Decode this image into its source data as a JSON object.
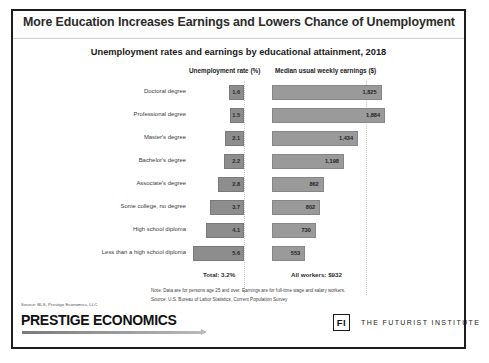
{
  "slide": {
    "title": "More Education Increases Earnings and Lowers Chance of Unemployment"
  },
  "chart_header": {
    "subtitle": "Unemployment rates and earnings by educational attainment, 2018",
    "left_column_header": "Unemployment rate (%)",
    "right_column_header": "Median usual weekly earnings ($)"
  },
  "totals": {
    "left": "Total: 3.2%",
    "right": "All workers: $932"
  },
  "notes": {
    "note": "Note: Data are for persons age 25 and over. Earnings are for full-time wage and salary workers.",
    "source": "Source: U.S. Bureau of Labor Statistics, Current Population Survey"
  },
  "footer": {
    "source_credit": "Source: BLS, Prestige Economics, LLC",
    "brand": "PRESTIGE ECONOMICS",
    "fi_mark": "FI",
    "fi_name": "THE FUTURIST INSTITUTE"
  },
  "colors": {
    "unemployment_bar": "#8d8d8d",
    "earnings_bar": "#9a9a9a",
    "frame": "#1c1c1c"
  },
  "chart_data": {
    "type": "bar",
    "title": "Unemployment rates and earnings by educational attainment, 2018",
    "orientation": "horizontal",
    "grid": true,
    "legend_position": "none",
    "categories": [
      "Doctoral degree",
      "Professional degree",
      "Master's degree",
      "Bachelor's degree",
      "Associate's degree",
      "Some college, no degree",
      "High school diploma",
      "Less than a high school diploma"
    ],
    "series": [
      {
        "name": "Unemployment rate (%)",
        "unit": "%",
        "axis": "left",
        "direction": "left",
        "xlim": [
          0,
          6
        ],
        "values": [
          1.6,
          1.5,
          2.1,
          2.2,
          2.8,
          3.7,
          4.1,
          5.6
        ],
        "labels": [
          "1.6",
          "1.5",
          "2.1",
          "2.2",
          "2.8",
          "3.7",
          "4.1",
          "5.6"
        ],
        "total_label": "Total: 3.2%",
        "total_value": 3.2
      },
      {
        "name": "Median usual weekly earnings ($)",
        "unit": "$",
        "axis": "right",
        "direction": "right",
        "xlim": [
          0,
          2000
        ],
        "values": [
          1825,
          1884,
          1434,
          1198,
          862,
          802,
          730,
          553
        ],
        "labels": [
          "1,825",
          "1,884",
          "1,434",
          "1,198",
          "862",
          "802",
          "730",
          "553"
        ],
        "total_label": "All workers: $932",
        "total_value": 932
      }
    ],
    "xlabel": "",
    "ylabel": "",
    "annotations": [
      "Note: Data are for persons age 25 and over. Earnings are for full-time wage and salary workers.",
      "Source: U.S. Bureau of Labor Statistics, Current Population Survey"
    ]
  }
}
